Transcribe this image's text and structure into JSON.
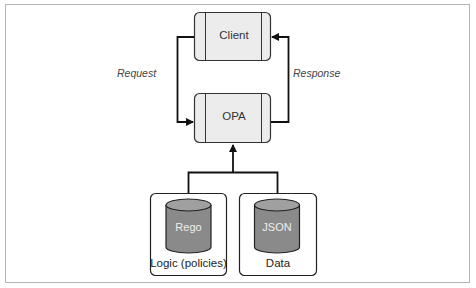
{
  "diagram": {
    "nodes": {
      "client": {
        "label": "Client"
      },
      "opa": {
        "label": "OPA"
      },
      "rego": {
        "label": "Rego",
        "caption": "Logic (policies)"
      },
      "json": {
        "label": "JSON",
        "caption": "Data"
      }
    },
    "edges": {
      "request": {
        "label": "Request",
        "from": "client",
        "to": "opa"
      },
      "response": {
        "label": "Response",
        "from": "opa",
        "to": "client"
      },
      "inputs": {
        "from": [
          "rego",
          "json"
        ],
        "to": "opa"
      }
    },
    "colors": {
      "box_fill": "#ececec",
      "box_stroke": "#333333",
      "cylinder_body": "#8a8a8a",
      "cylinder_top": "#a0a0a0",
      "line": "#111111",
      "frame": "#b5b5b5"
    }
  }
}
